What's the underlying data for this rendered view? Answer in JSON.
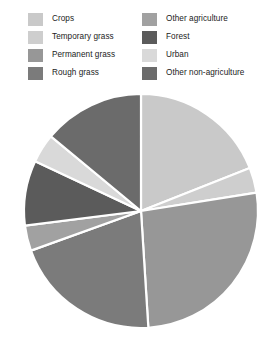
{
  "legend": {
    "columns": [
      {
        "items": [
          {
            "label": "Crops",
            "color": "#c9c9c9"
          },
          {
            "label": "Temporary grass",
            "color": "#cecece"
          },
          {
            "label": "Permanent grass",
            "color": "#979797"
          },
          {
            "label": "Rough grass",
            "color": "#7b7b7b"
          }
        ]
      },
      {
        "items": [
          {
            "label": "Other agriculture",
            "color": "#a1a1a1"
          },
          {
            "label": "Forest",
            "color": "#5b5b5b"
          },
          {
            "label": "Urban",
            "color": "#d9d9d9"
          },
          {
            "label": "Other non-agriculture",
            "color": "#6b6b6b"
          }
        ]
      }
    ]
  },
  "chart_data": {
    "type": "pie",
    "title": "",
    "subtitle": "",
    "xlabel": "",
    "ylabel": "",
    "legend_position": "top",
    "grid": false,
    "start_angle_deg": 0,
    "direction": "clockwise",
    "center": {
      "x": 141,
      "y": 127
    },
    "radius": 117,
    "separator_color": "#ffffff",
    "separator_width": 2.2,
    "labels": [
      "Crops",
      "Temporary grass",
      "Permanent grass",
      "Rough grass",
      "Other agriculture",
      "Forest",
      "Urban",
      "Other non-agriculture"
    ],
    "values": [
      19.0,
      3.5,
      26.5,
      20.5,
      3.5,
      9.0,
      4.0,
      14.0
    ],
    "unit": "%",
    "colors": [
      "#c9c9c9",
      "#cecece",
      "#979797",
      "#7b7b7b",
      "#a1a1a1",
      "#5b5b5b",
      "#d9d9d9",
      "#6b6b6b"
    ],
    "slices": [
      {
        "label": "Crops",
        "value": 19.0,
        "color": "#c9c9c9",
        "start_deg": 0.0,
        "end_deg": 68.4
      },
      {
        "label": "Temporary grass",
        "value": 3.5,
        "color": "#cecece",
        "start_deg": 68.4,
        "end_deg": 81.0
      },
      {
        "label": "Permanent grass",
        "value": 26.5,
        "color": "#979797",
        "start_deg": 81.0,
        "end_deg": 176.4
      },
      {
        "label": "Rough grass",
        "value": 20.5,
        "color": "#7b7b7b",
        "start_deg": 176.4,
        "end_deg": 250.2
      },
      {
        "label": "Other agriculture",
        "value": 3.5,
        "color": "#a1a1a1",
        "start_deg": 250.2,
        "end_deg": 262.8
      },
      {
        "label": "Forest",
        "value": 9.0,
        "color": "#5b5b5b",
        "start_deg": 262.8,
        "end_deg": 295.2
      },
      {
        "label": "Urban",
        "value": 4.0,
        "color": "#d9d9d9",
        "start_deg": 295.2,
        "end_deg": 309.6
      },
      {
        "label": "Other non-agriculture",
        "value": 14.0,
        "color": "#6b6b6b",
        "start_deg": 309.6,
        "end_deg": 360.0
      }
    ]
  }
}
